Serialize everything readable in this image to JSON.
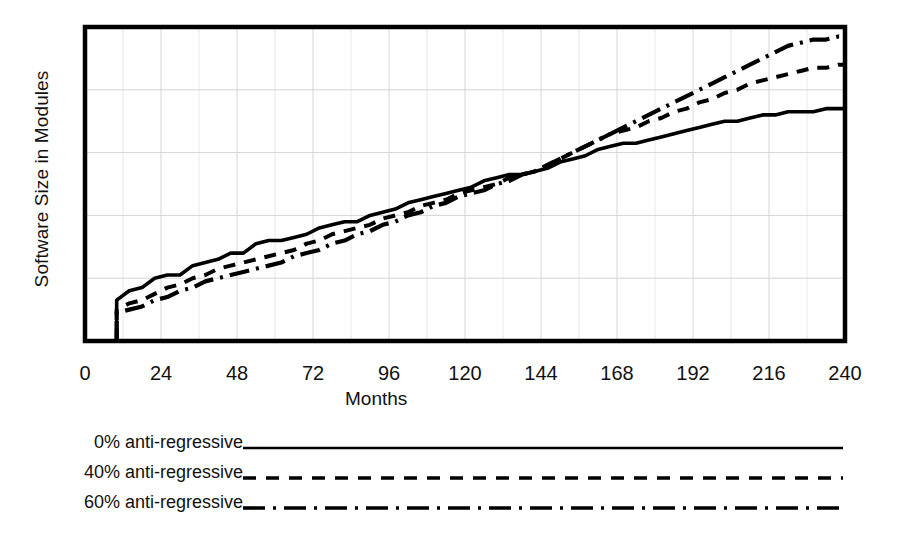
{
  "chart_data": {
    "type": "line",
    "title": "",
    "xlabel": "Months",
    "ylabel": "Software Size in Modules",
    "xlim": [
      0,
      240
    ],
    "ylim": [
      0,
      100
    ],
    "xticks": [
      "0",
      "24",
      "48",
      "72",
      "96",
      "120",
      "144",
      "168",
      "192",
      "216",
      "240"
    ],
    "xtick_values": [
      0,
      24,
      48,
      72,
      96,
      120,
      144,
      168,
      192,
      216,
      240
    ],
    "yticks": [],
    "grid": "both, light dotted; 4 horizontal gridlines, vertical gridline at every x tick",
    "legend_position": "below axes, left-aligned labels with line samples",
    "series": [
      {
        "name": "0% anti-regressive",
        "style": "solid",
        "x": [
          10,
          10,
          14,
          18,
          22,
          26,
          30,
          34,
          38,
          42,
          46,
          50,
          54,
          58,
          62,
          66,
          70,
          74,
          78,
          82,
          86,
          90,
          94,
          98,
          102,
          106,
          110,
          114,
          118,
          122,
          126,
          130,
          134,
          138,
          142,
          146,
          150,
          154,
          158,
          162,
          166,
          170,
          174,
          178,
          182,
          186,
          190,
          194,
          198,
          202,
          206,
          210,
          214,
          218,
          222,
          226,
          230,
          234,
          238,
          240
        ],
        "y": [
          0,
          13,
          16,
          17,
          20,
          21,
          21,
          24,
          25,
          26,
          28,
          28,
          31,
          32,
          32,
          33,
          34,
          36,
          37,
          38,
          38,
          40,
          41,
          42,
          44,
          45,
          46,
          47,
          48,
          49,
          51,
          52,
          53,
          53,
          54,
          55,
          57,
          58,
          59,
          61,
          62,
          63,
          63,
          64,
          65,
          66,
          67,
          68,
          69,
          70,
          70,
          71,
          72,
          72,
          73,
          73,
          73,
          74,
          74,
          74
        ]
      },
      {
        "name": "40% anti-regressive",
        "style": "dashed",
        "x": [
          10,
          10,
          14,
          18,
          22,
          26,
          30,
          34,
          38,
          42,
          46,
          50,
          54,
          58,
          62,
          66,
          70,
          74,
          78,
          82,
          86,
          90,
          94,
          98,
          102,
          106,
          110,
          114,
          118,
          122,
          126,
          130,
          134,
          138,
          142,
          146,
          150,
          154,
          158,
          162,
          166,
          170,
          174,
          178,
          182,
          186,
          190,
          194,
          198,
          202,
          206,
          210,
          214,
          218,
          222,
          226,
          230,
          234,
          238,
          240
        ],
        "y": [
          0,
          10,
          12,
          13,
          15,
          17,
          18,
          20,
          21,
          23,
          24,
          25,
          26,
          27,
          28,
          29,
          31,
          32,
          34,
          35,
          36,
          37,
          39,
          40,
          41,
          43,
          44,
          45,
          47,
          48,
          49,
          50,
          52,
          53,
          54,
          56,
          58,
          60,
          62,
          64,
          66,
          67,
          68,
          70,
          71,
          73,
          74,
          76,
          77,
          79,
          80,
          82,
          83,
          84,
          85,
          86,
          87,
          87,
          88,
          88
        ]
      },
      {
        "name": "60% anti-regressive",
        "style": "dashdot",
        "x": [
          10,
          10,
          14,
          18,
          22,
          26,
          30,
          34,
          38,
          42,
          46,
          50,
          54,
          58,
          62,
          66,
          70,
          74,
          78,
          82,
          86,
          90,
          94,
          98,
          102,
          106,
          110,
          114,
          118,
          122,
          126,
          130,
          134,
          138,
          142,
          146,
          150,
          154,
          158,
          162,
          166,
          170,
          174,
          178,
          182,
          186,
          190,
          194,
          198,
          202,
          206,
          210,
          214,
          218,
          222,
          226,
          230,
          234,
          238,
          240
        ],
        "y": [
          0,
          9,
          10,
          11,
          13,
          14,
          16,
          17,
          19,
          20,
          21,
          22,
          23,
          24,
          25,
          27,
          28,
          29,
          31,
          32,
          34,
          35,
          37,
          38,
          40,
          41,
          43,
          44,
          46,
          47,
          48,
          50,
          51,
          53,
          54,
          56,
          58,
          60,
          62,
          64,
          66,
          68,
          70,
          72,
          74,
          76,
          78,
          80,
          82,
          84,
          86,
          88,
          90,
          92,
          94,
          95,
          96,
          96,
          97,
          97
        ]
      }
    ]
  },
  "axes": {
    "ylabel": "Software Size in Modules",
    "xlabel": "Months",
    "xticks": [
      {
        "label": "0",
        "value": 0
      },
      {
        "label": "24",
        "value": 24
      },
      {
        "label": "48",
        "value": 48
      },
      {
        "label": "72",
        "value": 72
      },
      {
        "label": "96",
        "value": 96
      },
      {
        "label": "120",
        "value": 120
      },
      {
        "label": "144",
        "value": 144
      },
      {
        "label": "168",
        "value": 168
      },
      {
        "label": "192",
        "value": 192
      },
      {
        "label": "216",
        "value": 216
      },
      {
        "label": "240",
        "value": 240
      }
    ]
  },
  "legend": {
    "items": [
      {
        "label": "0% anti-regressive",
        "style": "solid"
      },
      {
        "label": "40% anti-regressive",
        "style": "dashed"
      },
      {
        "label": "60% anti-regressive",
        "style": "dashdot"
      }
    ]
  },
  "colors": {
    "ink": "#000000",
    "background": "#ffffff",
    "grid": "#d5d5d5"
  }
}
